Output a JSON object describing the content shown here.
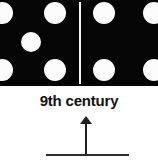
{
  "figure": {
    "caption": "9th century",
    "colors": {
      "tile_background": "#050505",
      "pip": "#fcfcfc",
      "divider": "#f2f2f2",
      "page_background": "#ffffff",
      "caption_text": "#121212",
      "arrow": "#1f1f1f",
      "baseline": "#2b2b2b"
    },
    "domino": {
      "left_half": {
        "pip_count": 5,
        "arrangement": "quincunx",
        "pips": [
          {
            "cx": 2,
            "cy": 13,
            "r": 11
          },
          {
            "cx": 55,
            "cy": 13,
            "r": 11
          },
          {
            "cx": 31,
            "cy": 42,
            "r": 10
          },
          {
            "cx": 2,
            "cy": 70,
            "r": 11
          },
          {
            "cx": 55,
            "cy": 70,
            "r": 11
          }
        ]
      },
      "right_half": {
        "pip_count": 4,
        "arrangement": "corners",
        "pips": [
          {
            "cx": 23,
            "cy": 13,
            "r": 11
          },
          {
            "cx": 73,
            "cy": 13,
            "r": 11
          },
          {
            "cx": 23,
            "cy": 70,
            "r": 11
          },
          {
            "cx": 73,
            "cy": 70,
            "r": 11
          }
        ]
      }
    },
    "annotation": {
      "arrow_direction": "up",
      "arrow_tip_y": 116,
      "baseline_y": 154
    }
  }
}
